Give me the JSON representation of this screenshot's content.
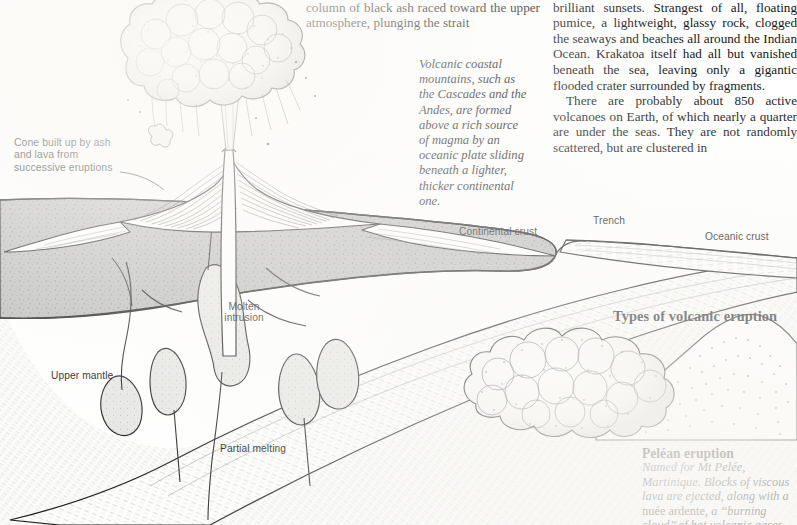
{
  "columns": {
    "middle": [
      "the greatest paroxysms ever recorded. A column of black ash raced toward the upper atmosphere, plunging the strait"
    ],
    "right": [
      "into the stratosphere, created abnormally brilliant sunsets. Strangest of all, floating pumice, a lightweight, glassy rock, clogged the seaways and beaches all around the Indian Ocean. Krakatoa itself had all but vanished beneath the sea, leaving only a gigantic flooded crater surrounded by fragments.",
      "There are probably about 850 active volcanoes on Earth, of which nearly a quarter are under the seas. They are not randomly scattered, but are clustered in"
    ]
  },
  "captions": {
    "volcanic_coastal": "Volcanic coastal mountains, such as the Cascades and the Andes, are formed above a rich source of magma by an oceanic plate sliding beneath a lighter, thicker continental one."
  },
  "diagram": {
    "labels": {
      "cone": "Cone built up by ash and lava from successive eruptions",
      "continental_crust": "Continental crust",
      "trench": "Trench",
      "oceanic_crust": "Oceanic crust",
      "molten_intrusion": "Molten intrusion",
      "upper_mantle": "Upper mantle",
      "partial_melting": "Partial melting"
    }
  },
  "eruption_section": {
    "heading": "Types of volcanic eruption",
    "pelean_title": "Peléan eruption",
    "pelean_text_1": "Named for Mt Pelée, Martinique. Blocks of viscous lava are ejected, along with a ",
    "pelean_text_roman": "nuée ardente,",
    "pelean_text_2": " a ‘‘burning cloud’’ of hot volcanic gases."
  },
  "colors": {
    "ink": "#151515",
    "crust_gray": "#b9b9b9",
    "mantle_light": "#f2f2f0",
    "paper": "#ffffff"
  }
}
